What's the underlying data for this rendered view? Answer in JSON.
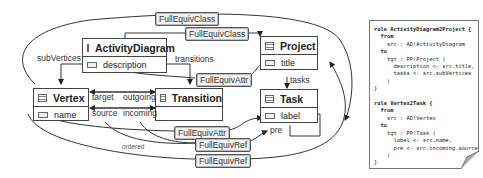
{
  "classes": {
    "activity_diagram": {
      "name": "ActivityDiagram",
      "attr": "description"
    },
    "project": {
      "name": "Project",
      "attr": "title"
    },
    "vertex": {
      "name": "Vertex",
      "attr": "name"
    },
    "transition": {
      "name": "Transition"
    },
    "task": {
      "name": "Task",
      "attr": "label"
    }
  },
  "roles": {
    "sub_vertices": "subVertices",
    "transitions": "transitions",
    "tasks": "tasks",
    "target": "target",
    "outgoing": "outgoing",
    "source": "source",
    "incoming": "incoming",
    "pre": "pre",
    "ordered": "ordered"
  },
  "tags": {
    "full_equiv_class_1": "FullEquivClass",
    "full_equiv_class_2": "FullEquivClass",
    "full_equiv_attr_1": "FullEquivAttr",
    "full_equiv_attr_2": "FullEquivAttr",
    "full_equiv_ref_1": "FullEquivRef",
    "full_equiv_ref_2": "FullEquivRef"
  },
  "code": {
    "r1_head": "rule ActivityDiagram2Project {",
    "r1_from": "  from",
    "r1_src": "    src : AD!ActivityDiagram",
    "r1_to": "  to",
    "r1_tgt": "    tgt : PP!Project (",
    "r1_b1": "      description <- src.title,",
    "r1_b2": "      tasks <- src.subVertices",
    "r1_b3": "    )",
    "r1_end": "}",
    "r2_head": "rule Vertex2Task {",
    "r2_from": "  from",
    "r2_src": "    src : AD!Vertex",
    "r2_to": "  to",
    "r2_tgt": "    tgt : PP!Task (",
    "r2_b1": "      label <- src.name,",
    "r2_b2": "      pre <- src.incoming.source",
    "r2_b3": "    )",
    "r2_end": "}"
  }
}
